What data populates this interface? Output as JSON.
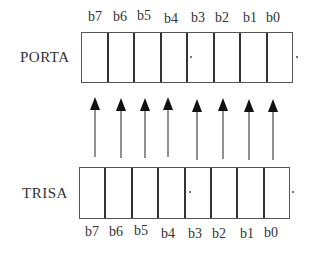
{
  "diagram": {
    "top_register": {
      "label": "PORTA",
      "bits": [
        "b7",
        "b6",
        "b5",
        "b4",
        "b3",
        "b2",
        "b1",
        "b0"
      ]
    },
    "bottom_register": {
      "label": "TRISA",
      "bits": [
        "b7",
        "b6",
        "b5",
        "b4",
        "b3",
        "b2",
        "b1",
        "b0"
      ]
    },
    "arrows": {
      "count": 8,
      "direction": "up",
      "from": "TRISA",
      "to": "PORTA"
    },
    "colors": {
      "line": "#333333",
      "arrow": "#111111",
      "background": "#ffffff"
    }
  }
}
